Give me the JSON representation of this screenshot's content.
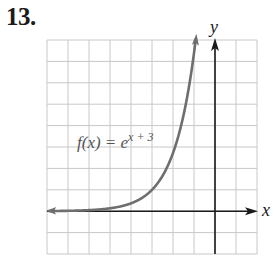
{
  "problem": {
    "number": "13."
  },
  "colors": {
    "grid": "#c8c8c8",
    "axis": "#1a1a1a",
    "curve": "#6e6e6e",
    "label": "#555555",
    "text": "#1a1a1a"
  },
  "chart_data": {
    "type": "line",
    "title": "",
    "function_label": "f(x) = e^(x + 3)",
    "function_label_parts": {
      "lhs": "f(x) = e",
      "exponent": "x + 3"
    },
    "xlabel": "x",
    "ylabel": "y",
    "xlim": [
      -8,
      2
    ],
    "ylim": [
      -2,
      8
    ],
    "grid": true,
    "grid_step": 1,
    "tick_labels": false,
    "series": [
      {
        "name": "f(x) = e^(x+3)",
        "x": [
          -8,
          -7,
          -6,
          -5,
          -4,
          -3,
          -2,
          -1.5,
          -1,
          -0.91
        ],
        "values": [
          0.0067,
          0.018,
          0.05,
          0.135,
          0.368,
          1.0,
          2.718,
          4.48,
          7.389,
          8.1
        ]
      }
    ],
    "horizontal_asymptote": "y = 0"
  }
}
